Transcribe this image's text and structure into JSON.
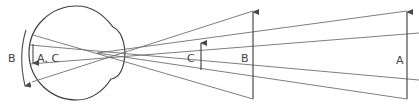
{
  "diagram": {
    "colors": {
      "stroke": "#4a4a4a",
      "ray": "#6f6f6f",
      "label": "#444444",
      "background": "#ffffff"
    },
    "eye": {
      "label_outer_arrow": "B",
      "label_inner_arrow": "A, C"
    },
    "objects": [
      {
        "id": "C",
        "label": "C",
        "x": 201,
        "base_y": 70,
        "top_y": 42,
        "relative_distance": "near",
        "relative_size": "small"
      },
      {
        "id": "B",
        "label": "B",
        "x": 253,
        "base_y": 99,
        "top_y": 11,
        "relative_distance": "near",
        "relative_size": "large"
      },
      {
        "id": "A",
        "label": "A",
        "x": 407,
        "base_y": 99,
        "top_y": 11,
        "relative_distance": "far",
        "relative_size": "large"
      }
    ]
  }
}
